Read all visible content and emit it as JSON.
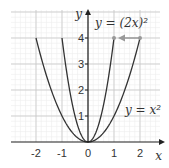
{
  "chart_data": {
    "type": "line",
    "title": "",
    "xlabel": "x",
    "ylabel": "y",
    "xlim": [
      -2.9,
      2.8
    ],
    "ylim": [
      0,
      5
    ],
    "grid": true,
    "x_ticks": [
      "-2",
      "-1",
      "0",
      "1",
      "2"
    ],
    "y_ticks": [
      "1",
      "2",
      "3",
      "4"
    ],
    "series": [
      {
        "name": "y = x²",
        "function": "x^2",
        "x_range": [
          -2,
          2
        ],
        "color": "#333333"
      },
      {
        "name": "y = (2x)²",
        "function": "(2x)^2",
        "x_range": [
          -1,
          1
        ],
        "color": "#333333"
      }
    ],
    "annotations": [
      {
        "text": "y = (2x)²",
        "x": 0.9,
        "y": 4.45
      },
      {
        "text": "y = x²",
        "x": 1.8,
        "y": 1.3
      },
      {
        "type": "arrow",
        "from": [
          2,
          4
        ],
        "to": [
          1,
          4
        ],
        "color": "#999999"
      }
    ],
    "points": [
      [
        1,
        4
      ],
      [
        2,
        4
      ]
    ]
  }
}
